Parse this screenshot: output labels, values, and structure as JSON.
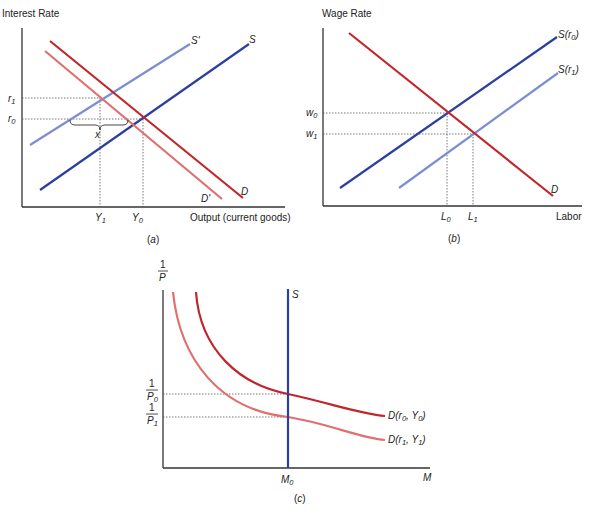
{
  "panels": {
    "a": {
      "caption": "(a)",
      "caption_letter": "a",
      "y_axis_label": "Interest Rate",
      "x_axis_label": "Output (current goods)",
      "curves": {
        "S": {
          "label": "S",
          "color": "#2b3fa0"
        },
        "S_prime": {
          "label": "S'",
          "color": "#7b8fd0"
        },
        "D": {
          "label": "D",
          "color": "#c0262c"
        },
        "D_prime": {
          "label": "D'",
          "color": "#e07070"
        }
      },
      "y_ticks": {
        "r1": {
          "base": "r",
          "sub": "1"
        },
        "r0": {
          "base": "r",
          "sub": "0"
        }
      },
      "x_ticks": {
        "Y1": {
          "base": "Y",
          "sub": "1"
        },
        "Y0": {
          "base": "Y",
          "sub": "0"
        }
      },
      "brace_label": "x"
    },
    "b": {
      "caption": "(b)",
      "caption_letter": "b",
      "y_axis_label": "Wage Rate",
      "x_axis_label": "Labor",
      "curves": {
        "S_r0": {
          "label_prefix": "S(",
          "base": "r",
          "sub": "0",
          "suffix": ")",
          "color": "#2b3fa0"
        },
        "S_r1": {
          "label_prefix": "S(",
          "base": "r",
          "sub": "1",
          "suffix": ")",
          "color": "#7b8fd0"
        },
        "D": {
          "label": "D",
          "color": "#c0262c"
        }
      },
      "y_ticks": {
        "w0": {
          "base": "w",
          "sub": "0"
        },
        "w1": {
          "base": "w",
          "sub": "1"
        }
      },
      "x_ticks": {
        "L0": {
          "base": "L",
          "sub": "0"
        },
        "L1": {
          "base": "L",
          "sub": "1"
        }
      }
    },
    "c": {
      "caption": "(c)",
      "caption_letter": "c",
      "y_axis_label_num": "1",
      "y_axis_label_den": "P",
      "x_axis_label": "M",
      "curves": {
        "S": {
          "label": "S",
          "color": "#2b3fa0"
        },
        "D_r0_Y0": {
          "prefix": "D(",
          "a": "r",
          "a_sub": "0",
          "sep": ", ",
          "b": "Y",
          "b_sub": "0",
          "suffix": ")",
          "color": "#c0262c"
        },
        "D_r1_Y1": {
          "prefix": "D(",
          "a": "r",
          "a_sub": "1",
          "sep": ", ",
          "b": "Y",
          "b_sub": "1",
          "suffix": ")",
          "color": "#e07070"
        }
      },
      "y_ticks": {
        "inv_P0": {
          "num": "1",
          "den": "P",
          "sub": "0"
        },
        "inv_P1": {
          "num": "1",
          "den": "P",
          "sub": "1"
        }
      },
      "x_ticks": {
        "M0": {
          "base": "M",
          "sub": "0"
        }
      }
    }
  }
}
